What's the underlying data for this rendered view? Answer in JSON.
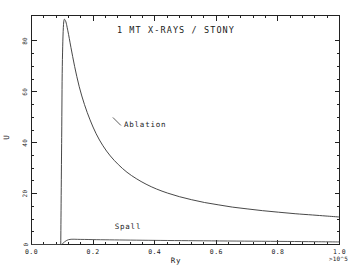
{
  "chart_data": {
    "type": "line",
    "title": "1 MT X-RAYS / STONY",
    "xlabel": "Ry",
    "ylabel": "U",
    "x_exponent_note": ">10^5",
    "xlim": [
      0.0,
      1.0
    ],
    "ylim": [
      0,
      90
    ],
    "grid": false,
    "legend_position": "inline-annotations",
    "xticks": [
      "0.0",
      "0.2",
      "0.4",
      "0.6",
      "0.8",
      "1.0"
    ],
    "xtick_values": [
      0.0,
      0.2,
      0.4,
      0.6,
      0.8,
      1.0
    ],
    "yticks": [
      "0",
      "20",
      "40",
      "60",
      "80"
    ],
    "ytick_values": [
      0,
      20,
      40,
      60,
      80
    ],
    "x_minor_count": 5,
    "y_minor_count": 4,
    "annotations": [
      {
        "label": "Ablation",
        "x": 0.3,
        "y": 46
      },
      {
        "label": "Spall",
        "x": 0.27,
        "y": 6
      }
    ],
    "series": [
      {
        "name": "Ablation",
        "x": [
          0.095,
          0.098,
          0.1,
          0.104,
          0.11,
          0.118,
          0.128,
          0.14,
          0.155,
          0.172,
          0.19,
          0.21,
          0.232,
          0.256,
          0.282,
          0.31,
          0.34,
          0.372,
          0.406,
          0.442,
          0.48,
          0.52,
          0.562,
          0.606,
          0.652,
          0.7,
          0.75,
          0.802,
          0.856,
          0.912,
          0.956,
          1.0
        ],
        "y": [
          0.0,
          42.0,
          70.0,
          86.5,
          88.0,
          84.0,
          77.5,
          70.0,
          62.0,
          55.0,
          49.0,
          43.5,
          38.8,
          34.8,
          31.4,
          28.4,
          25.9,
          23.7,
          21.8,
          20.2,
          18.8,
          17.6,
          16.5,
          15.6,
          14.7,
          14.0,
          13.3,
          12.7,
          12.1,
          11.6,
          11.2,
          10.8
        ]
      },
      {
        "name": "Spall",
        "x": [
          0.098,
          0.12,
          0.16,
          0.21,
          0.27,
          0.34,
          0.42,
          0.51,
          0.61,
          0.72,
          0.83,
          0.92,
          1.0
        ],
        "y": [
          0.0,
          1.9,
          2.0,
          1.9,
          1.8,
          1.7,
          1.6,
          1.5,
          1.4,
          1.3,
          1.2,
          1.1,
          1.0
        ]
      }
    ]
  }
}
